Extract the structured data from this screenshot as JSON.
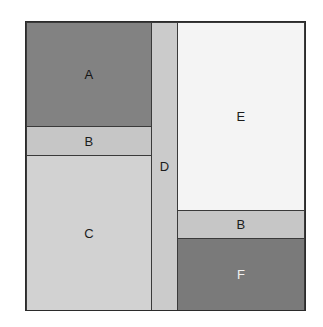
{
  "figure": {
    "name": "squared-square-partition-diagram",
    "background_color": "#ffffff",
    "frame": {
      "border_color": "#2b2b2b",
      "x": 25,
      "y": 21,
      "width": 281,
      "height": 290
    }
  },
  "regions": [
    {
      "id": "A",
      "label": "A",
      "fill": "#828282",
      "tone": "dark",
      "column": "left",
      "order": 1
    },
    {
      "id": "B1",
      "label": "B",
      "fill": "#c6c6c6",
      "tone": "light",
      "column": "left",
      "order": 2
    },
    {
      "id": "C",
      "label": "C",
      "fill": "#d2d2d2",
      "tone": "light",
      "column": "left",
      "order": 3
    },
    {
      "id": "D",
      "label": "D",
      "fill": "#cbcbcb",
      "tone": "light",
      "column": "middle",
      "order": 1
    },
    {
      "id": "E",
      "label": "E",
      "fill": "#f4f4f4",
      "tone": "lightest",
      "column": "right",
      "order": 1
    },
    {
      "id": "B2",
      "label": "B",
      "fill": "#c6c6c6",
      "tone": "light",
      "column": "right",
      "order": 2
    },
    {
      "id": "F",
      "label": "F",
      "fill": "#7a7a7a",
      "tone": "darkest",
      "column": "right",
      "order": 3
    }
  ]
}
